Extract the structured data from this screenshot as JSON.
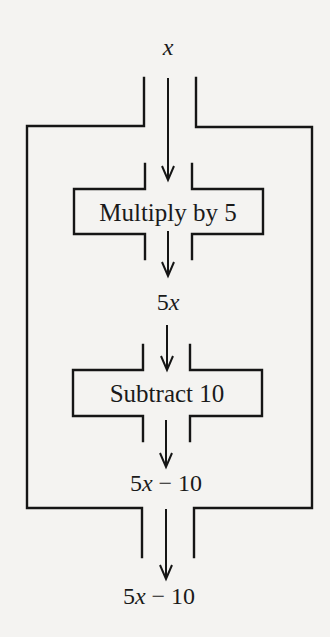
{
  "diagram": {
    "type": "function-machine",
    "input_label": {
      "var": "x"
    },
    "steps": [
      {
        "label": "Multiply by 5",
        "output": {
          "coef": "5",
          "var": "x",
          "rest": ""
        }
      },
      {
        "label": "Subtract 10",
        "output": {
          "coef": "5",
          "var": "x",
          "rest": " − 10"
        }
      }
    ],
    "machine_output": {
      "coef": "5",
      "var": "x",
      "rest": " − 10"
    },
    "final_output": {
      "coef": "5",
      "var": "x",
      "rest": " − 10"
    }
  }
}
